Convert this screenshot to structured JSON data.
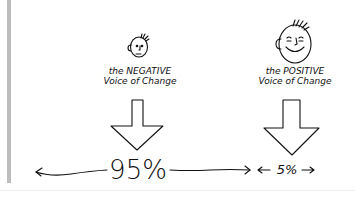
{
  "diagram": {
    "negative": {
      "line1": "the NEGATIVE",
      "line2": "Voice of Change",
      "face": "frowning-face-icon",
      "percent": "95%"
    },
    "positive": {
      "line1": "the POSITIVE",
      "line2": "Voice of Change",
      "face": "smiling-face-icon",
      "percent": "5%"
    },
    "colors": {
      "ink": "#111111",
      "sidebar": "#bdbdbd",
      "background": "#ffffff"
    }
  }
}
